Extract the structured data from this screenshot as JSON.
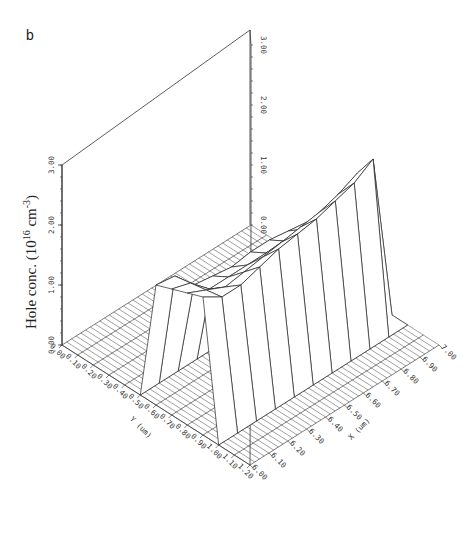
{
  "panel_label": "b",
  "chart_data": {
    "type": "surface3d",
    "title": "",
    "zlabel": {
      "prefix": "Hole conc. (10",
      "exp1": "16",
      "mid": " cm",
      "exp2": "-3",
      "suffix": ")"
    },
    "xlabel": "X (um)",
    "ylabel": "Y (um)",
    "xlim": [
      6.0,
      7.0
    ],
    "ylim": [
      0.0,
      1.2
    ],
    "zlim": [
      0.0,
      3.0
    ],
    "x_ticks": [
      "6.00",
      "6.10",
      "6.20",
      "6.30",
      "6.40",
      "6.50",
      "6.60",
      "6.70",
      "6.80",
      "6.90",
      "7.00"
    ],
    "y_ticks": [
      "0.00",
      "0.10",
      "0.20",
      "0.30",
      "0.40",
      "0.50",
      "0.60",
      "0.70",
      "0.80",
      "0.90",
      "1.00",
      "1.10",
      "1.20"
    ],
    "z_ticks_left": [
      "0.00",
      "1.00",
      "2.00",
      "3.00"
    ],
    "z_ticks_right": [
      "0.00",
      "1.00",
      "2.00",
      "3.00"
    ],
    "grid_x": [
      6.0,
      6.1,
      6.2,
      6.3,
      6.4,
      6.5,
      6.6,
      6.7,
      6.8,
      6.9,
      7.0
    ],
    "grid_y": [
      0.5,
      0.6,
      0.7,
      0.8,
      0.9,
      1.0
    ],
    "z_values": [
      [
        0.0,
        0.0,
        0.0,
        0.0,
        0.0,
        0.0,
        0.0,
        0.0,
        0.0,
        0.0,
        0.0
      ],
      [
        2.0,
        1.95,
        1.6,
        1.55,
        1.5,
        1.55,
        1.55,
        1.5,
        1.45,
        1.4,
        0.0
      ],
      [
        2.1,
        2.0,
        1.7,
        1.7,
        1.7,
        1.7,
        1.7,
        1.7,
        1.7,
        1.7,
        0.0
      ],
      [
        2.2,
        2.05,
        1.9,
        1.95,
        2.0,
        2.05,
        2.1,
        2.15,
        2.25,
        2.4,
        0.0
      ],
      [
        2.3,
        2.1,
        2.1,
        2.2,
        2.3,
        2.35,
        2.4,
        2.5,
        2.6,
        2.8,
        0.0
      ],
      [
        0.0,
        0.0,
        0.0,
        0.0,
        0.0,
        0.0,
        0.0,
        0.0,
        0.0,
        0.0,
        0.0
      ]
    ]
  }
}
